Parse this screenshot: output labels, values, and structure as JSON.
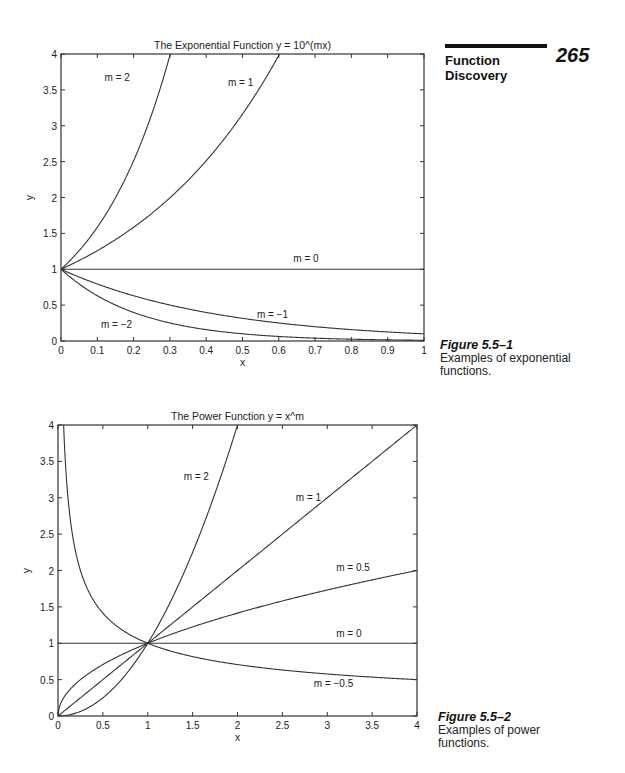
{
  "page": {
    "page_number": "265",
    "section_title_line1": "Function",
    "section_title_line2": "Discovery"
  },
  "figures": [
    {
      "label": "Figure 5.5–1",
      "caption_line1": "Examples of exponential",
      "caption_line2": "functions."
    },
    {
      "label": "Figure 5.5–2",
      "caption_line1": "Examples of power",
      "caption_line2": "functions."
    }
  ],
  "chart_data": [
    {
      "type": "line",
      "title": "The Exponential Function y = 10^(mx)",
      "xlabel": "x",
      "ylabel": "y",
      "xlim": [
        0,
        1
      ],
      "ylim": [
        0,
        4
      ],
      "xticks": [
        "0",
        "0.1",
        "0.2",
        "0.3",
        "0.4",
        "0.5",
        "0.6",
        "0.7",
        "0.8",
        "0.9",
        "1"
      ],
      "yticks": [
        "0",
        "0.5",
        "1",
        "1.5",
        "2",
        "2.5",
        "3",
        "3.5",
        "4"
      ],
      "grid": false,
      "legend": "inline labels",
      "series": [
        {
          "name": "m = 2",
          "function": "10^(2x)",
          "label_pos": [
            0.12,
            3.62
          ]
        },
        {
          "name": "m = 1",
          "function": "10^(x)",
          "label_pos": [
            0.46,
            3.55
          ]
        },
        {
          "name": "m = 0",
          "function": "1",
          "label_pos": [
            0.64,
            1.1
          ]
        },
        {
          "name": "m = −1",
          "function": "10^(-x)",
          "label_pos": [
            0.54,
            0.32
          ]
        },
        {
          "name": "m = −2",
          "function": "10^(-2x)",
          "label_pos": [
            0.11,
            0.18
          ]
        }
      ]
    },
    {
      "type": "line",
      "title": "The Power Function y = x^m",
      "xlabel": "x",
      "ylabel": "y",
      "xlim": [
        0,
        4
      ],
      "ylim": [
        0,
        4
      ],
      "xticks": [
        "0",
        "0.5",
        "1",
        "1.5",
        "2",
        "2.5",
        "3",
        "3.5",
        "4"
      ],
      "yticks": [
        "0",
        "0.5",
        "1",
        "1.5",
        "2",
        "2.5",
        "3",
        "3.5",
        "4"
      ],
      "grid": false,
      "legend": "inline labels",
      "series": [
        {
          "name": "m = 2",
          "function": "x^2",
          "label_pos": [
            1.4,
            3.25
          ]
        },
        {
          "name": "m = 1",
          "function": "x",
          "label_pos": [
            2.65,
            2.95
          ]
        },
        {
          "name": "m = 0.5",
          "function": "x^0.5",
          "label_pos": [
            3.1,
            2.0
          ]
        },
        {
          "name": "m = 0",
          "function": "1",
          "label_pos": [
            3.1,
            1.08
          ]
        },
        {
          "name": "m = −0.5",
          "function": "x^-0.5",
          "label_pos": [
            2.85,
            0.4
          ]
        }
      ]
    }
  ]
}
